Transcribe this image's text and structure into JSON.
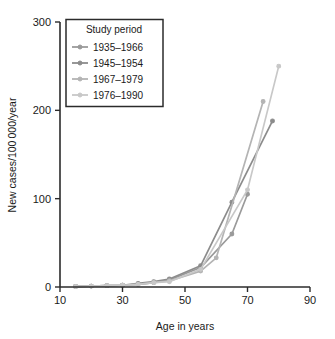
{
  "chart_data": {
    "type": "line",
    "title": "",
    "xlabel": "Age in years",
    "ylabel": "New cases/100 000/year",
    "xlim": [
      10,
      90
    ],
    "ylim": [
      0,
      300
    ],
    "xticks": [
      10,
      30,
      50,
      70,
      90
    ],
    "yticks": [
      0,
      100,
      200,
      300
    ],
    "xtick_labels": [
      "10",
      "30",
      "50",
      "70",
      "90"
    ],
    "ytick_labels": [
      "0",
      "100",
      "200",
      "300"
    ],
    "grid": false,
    "legend_position": "upper left",
    "legend_title": "Study period",
    "series": [
      {
        "name": "1935–1966",
        "color": "#9a9a9a",
        "x": [
          15,
          20,
          25,
          30,
          35,
          40,
          45,
          55,
          65,
          70
        ],
        "values": [
          0.5,
          1,
          1.5,
          2,
          3,
          5,
          8,
          22,
          60,
          105
        ]
      },
      {
        "name": "1945–1954",
        "color": "#8c8c8c",
        "x": [
          15,
          20,
          25,
          30,
          35,
          40,
          45,
          55,
          65,
          78
        ],
        "values": [
          0.5,
          1,
          1.5,
          2,
          4,
          6,
          9,
          24,
          96,
          188
        ]
      },
      {
        "name": "1967–1979",
        "color": "#b4b4b4",
        "x": [
          15,
          20,
          25,
          30,
          35,
          40,
          45,
          55,
          60,
          75
        ],
        "values": [
          0.5,
          1,
          1.5,
          2,
          3,
          5,
          7,
          18,
          33,
          210
        ]
      },
      {
        "name": "1976–1990",
        "color": "#c8c8c8",
        "x": [
          15,
          20,
          25,
          30,
          35,
          40,
          45,
          55,
          70,
          80
        ],
        "values": [
          0.5,
          1,
          1.5,
          2,
          3,
          5,
          6,
          20,
          110,
          250
        ]
      }
    ]
  },
  "layout": {
    "plot_left": 60,
    "plot_right": 310,
    "plot_top": 22,
    "plot_bottom": 287
  }
}
